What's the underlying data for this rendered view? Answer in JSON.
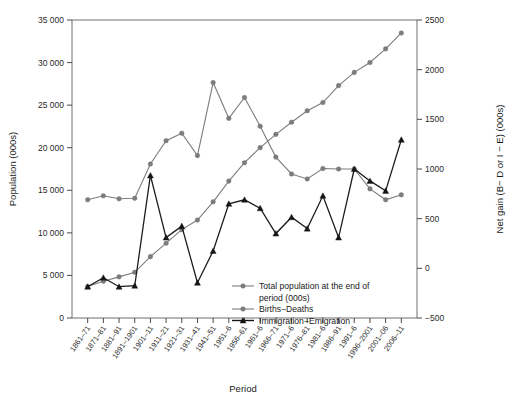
{
  "chart_data": {
    "type": "line",
    "title": "",
    "xlabel": "Period",
    "ylabel": "Population (000s)",
    "y2label": "Net gain (B− D or I − E) (000s)",
    "grid": false,
    "legend_position": "inside-bottom-right",
    "ylim": [
      0,
      35000
    ],
    "y2lim": [
      -500,
      2500
    ],
    "yticks": [
      "0",
      "5 000",
      "10 000",
      "15 000",
      "20 000",
      "25 000",
      "30 000",
      "35 000"
    ],
    "ytick_values": [
      0,
      5000,
      10000,
      15000,
      20000,
      25000,
      30000,
      35000
    ],
    "y2ticks": [
      "−500",
      "0",
      "500",
      "1000",
      "1500",
      "2000",
      "2500"
    ],
    "y2tick_values": [
      -500,
      0,
      500,
      1000,
      1500,
      2000,
      2500
    ],
    "categories": [
      "1861–71",
      "1871–81",
      "1881–91",
      "1891–1901",
      "1901–11",
      "1911–21",
      "1921–31",
      "1931–41",
      "1941–51",
      "1951–6",
      "1956–61",
      "1961–6",
      "1966–71",
      "1971–6",
      "1976–81",
      "1981–6",
      "1986–91",
      "1991–6",
      "1996–2001",
      "2001–06",
      "2006–11"
    ],
    "series": [
      {
        "name": "Total population at the end of period (000s)",
        "axis": "left",
        "marker": "circle",
        "color": "#7d7d7d",
        "values": [
          3689,
          4325,
          4833,
          5371,
          7207,
          8788,
          10377,
          11507,
          13648,
          16081,
          18238,
          20015,
          21568,
          22993,
          24343,
          25309,
          27297,
          28847,
          30007,
          31613,
          33477
        ]
      },
      {
        "name": "Births−Deaths",
        "axis": "right",
        "marker": "circle",
        "color": "#7d7d7d",
        "values": [
          690,
          730,
          700,
          705,
          1050,
          1285,
          1360,
          1135,
          1870,
          1510,
          1720,
          1430,
          1120,
          950,
          900,
          1005,
          1000,
          1000,
          800,
          690,
          740
        ]
      },
      {
        "name": "Immigration−Emigration",
        "axis": "right",
        "marker": "triangle",
        "color": "#151515",
        "values": [
          -185,
          -95,
          -185,
          -175,
          935,
          310,
          425,
          -145,
          175,
          650,
          690,
          605,
          350,
          515,
          400,
          730,
          310,
          1000,
          880,
          780,
          1295
        ]
      }
    ],
    "legend": [
      {
        "label": "Total population at the end of",
        "label2": "period (000s)",
        "marker": "circle",
        "color": "#7d7d7d"
      },
      {
        "label": "Births−Deaths",
        "marker": "circle",
        "color": "#7d7d7d"
      },
      {
        "label": "Immigration−Emigration",
        "marker": "triangle",
        "color": "#151515"
      }
    ]
  },
  "axes": {
    "left_title": "Population (000s)",
    "right_title": "Net gain (B− D or I − E) (000s)",
    "bottom_title": "Period"
  }
}
